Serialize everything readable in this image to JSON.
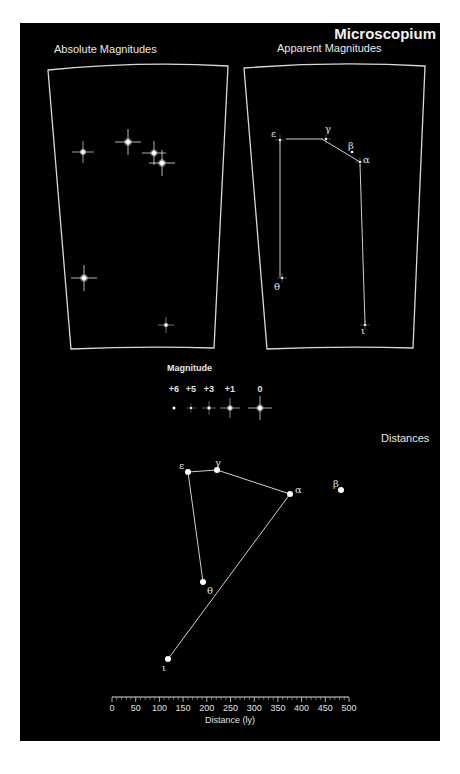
{
  "title": "Microscopium",
  "panels": {
    "absolute": {
      "label": "Absolute Magnitudes"
    },
    "apparent": {
      "label": "Apparent Magnitudes"
    },
    "distances": {
      "label": "Distances"
    }
  },
  "legend": {
    "title": "Magnitude",
    "entries": [
      "+6",
      "+5",
      "+3",
      "+1",
      "0"
    ]
  },
  "stars": {
    "epsilon": "ε",
    "gamma": "γ",
    "beta": "β",
    "alpha": "α",
    "theta": "θ",
    "iota": "ι"
  },
  "axis": {
    "label": "Distance (ly)",
    "ticks": [
      "0",
      "50",
      "100",
      "150",
      "200",
      "250",
      "300",
      "350",
      "400",
      "450",
      "500"
    ]
  },
  "colors": {
    "background": "#000000",
    "foreground": "#e8e8e8",
    "page": "#ffffff"
  }
}
